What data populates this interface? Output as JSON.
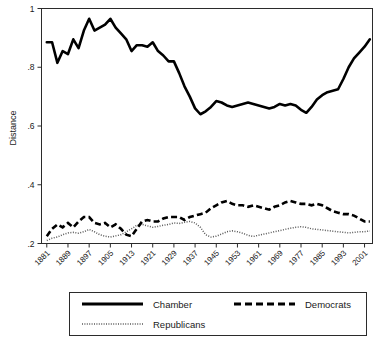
{
  "figure": {
    "background_color": "#ffffff",
    "frame_color": "#2b2b2b"
  },
  "axis": {
    "y_title": "Distance",
    "y_ticks": [
      "1",
      ".8",
      ".6",
      ".4",
      ".2"
    ],
    "x_ticks": [
      "1881",
      "1889",
      "1897",
      "1905",
      "1913",
      "1921",
      "1929",
      "1937",
      "1945",
      "1953",
      "1961",
      "1969",
      "1977",
      "1985",
      "1993",
      "2001"
    ]
  },
  "legend": {
    "items": [
      {
        "label": "Chamber",
        "style": "solid-thick",
        "color": "#000000"
      },
      {
        "label": "Democrats",
        "style": "dashed-thick",
        "color": "#000000"
      },
      {
        "label": "Republicans",
        "style": "dotted-thin",
        "color": "#5a5a5a"
      }
    ]
  },
  "chart_data": {
    "type": "line",
    "title": "",
    "xlabel": "",
    "ylabel": "Distance",
    "xlim": [
      1879,
      2004
    ],
    "ylim": [
      0.2,
      1.0
    ],
    "grid": false,
    "legend_position": "below-plot",
    "x_tick_labels": [
      "1881",
      "1889",
      "1897",
      "1905",
      "1913",
      "1921",
      "1929",
      "1937",
      "1945",
      "1953",
      "1961",
      "1969",
      "1977",
      "1985",
      "1993",
      "2001"
    ],
    "y_tick_labels": [
      "1",
      ".8",
      ".6",
      ".4",
      ".2"
    ],
    "x": [
      1881,
      1883,
      1885,
      1887,
      1889,
      1891,
      1893,
      1895,
      1897,
      1899,
      1901,
      1903,
      1905,
      1907,
      1909,
      1911,
      1913,
      1915,
      1917,
      1919,
      1921,
      1923,
      1925,
      1927,
      1929,
      1931,
      1933,
      1935,
      1937,
      1939,
      1941,
      1943,
      1945,
      1947,
      1949,
      1951,
      1953,
      1955,
      1957,
      1959,
      1961,
      1963,
      1965,
      1967,
      1969,
      1971,
      1973,
      1975,
      1977,
      1979,
      1981,
      1983,
      1985,
      1987,
      1989,
      1991,
      1993,
      1995,
      1997,
      1999,
      2001,
      2003
    ],
    "series": [
      {
        "name": "Chamber",
        "style": "solid-thick",
        "color": "#000000",
        "values": [
          0.885,
          0.885,
          0.815,
          0.855,
          0.845,
          0.895,
          0.865,
          0.925,
          0.965,
          0.925,
          0.935,
          0.945,
          0.965,
          0.935,
          0.915,
          0.895,
          0.855,
          0.875,
          0.875,
          0.87,
          0.885,
          0.855,
          0.84,
          0.82,
          0.82,
          0.78,
          0.735,
          0.7,
          0.66,
          0.64,
          0.65,
          0.665,
          0.685,
          0.68,
          0.67,
          0.665,
          0.67,
          0.675,
          0.68,
          0.675,
          0.67,
          0.665,
          0.66,
          0.665,
          0.675,
          0.67,
          0.675,
          0.67,
          0.655,
          0.645,
          0.665,
          0.69,
          0.705,
          0.715,
          0.72,
          0.725,
          0.76,
          0.8,
          0.83,
          0.85,
          0.87,
          0.895
        ]
      },
      {
        "name": "Democrats",
        "style": "dashed-thick",
        "color": "#000000",
        "values": [
          0.225,
          0.25,
          0.265,
          0.255,
          0.27,
          0.255,
          0.275,
          0.29,
          0.29,
          0.27,
          0.265,
          0.27,
          0.255,
          0.265,
          0.25,
          0.23,
          0.225,
          0.25,
          0.275,
          0.28,
          0.275,
          0.275,
          0.285,
          0.29,
          0.29,
          0.29,
          0.28,
          0.29,
          0.295,
          0.3,
          0.305,
          0.32,
          0.33,
          0.34,
          0.345,
          0.335,
          0.33,
          0.33,
          0.325,
          0.33,
          0.325,
          0.32,
          0.315,
          0.325,
          0.33,
          0.34,
          0.345,
          0.34,
          0.335,
          0.335,
          0.33,
          0.335,
          0.33,
          0.32,
          0.31,
          0.305,
          0.3,
          0.3,
          0.295,
          0.285,
          0.275,
          0.275
        ]
      },
      {
        "name": "Republicans",
        "style": "dotted-thin",
        "color": "#5a5a5a",
        "values": [
          0.21,
          0.218,
          0.222,
          0.23,
          0.236,
          0.238,
          0.235,
          0.24,
          0.248,
          0.24,
          0.23,
          0.225,
          0.222,
          0.226,
          0.23,
          0.24,
          0.25,
          0.262,
          0.265,
          0.26,
          0.255,
          0.258,
          0.262,
          0.265,
          0.27,
          0.268,
          0.272,
          0.275,
          0.27,
          0.255,
          0.23,
          0.222,
          0.225,
          0.232,
          0.24,
          0.243,
          0.24,
          0.235,
          0.228,
          0.224,
          0.228,
          0.232,
          0.236,
          0.24,
          0.244,
          0.248,
          0.252,
          0.255,
          0.257,
          0.255,
          0.25,
          0.248,
          0.246,
          0.244,
          0.242,
          0.24,
          0.238,
          0.236,
          0.238,
          0.24,
          0.24,
          0.243
        ]
      }
    ]
  }
}
